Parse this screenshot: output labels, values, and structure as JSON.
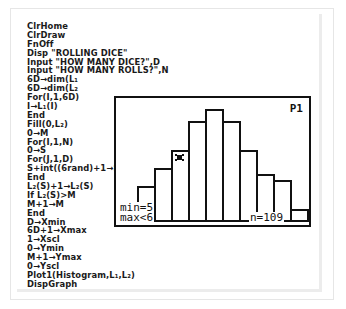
{
  "program": {
    "lines": [
      "ClrHome",
      "ClrDraw",
      "FnOff",
      "Disp \"ROLLING DICE\"",
      "Input \"HOW MANY DICE?\",D",
      "Input \"HOW MANY ROLLS?\",N",
      "6D→dim(L₁",
      "6D→dim(L₂",
      "For(I,1,6D)",
      "I→L₁(I)",
      "End",
      "Fill(0,L₂)",
      "0→M",
      "For(I,1,N)",
      "0→S",
      "For(J,1,D)",
      "S+int((6rand)+1→S",
      "End",
      "L₂(S)+1→L₂(S)",
      "If L₂(S)>M",
      "M+1→M",
      "End",
      "D→Xmin",
      "6D+1→Xmax",
      "1→Xscl",
      "0→Ymin",
      "M+1→Ymax",
      "0→Yscl",
      "Plot1(Histogram,L₁,L₂)",
      "DispGraph"
    ]
  },
  "graph_screen": {
    "plot_label": "P1",
    "trace": {
      "min_label": "min=5",
      "max_label": "max<6",
      "n_label": "n=109"
    }
  },
  "chart_data": {
    "type": "bar",
    "title": "",
    "xlabel": "",
    "ylabel": "",
    "categories": [
      "3",
      "4",
      "5",
      "6",
      "7",
      "8",
      "9",
      "10",
      "11",
      "12"
    ],
    "values": [
      6,
      9,
      12,
      17,
      19,
      17,
      12,
      8,
      7,
      2
    ],
    "legend": [
      "P1"
    ],
    "grid": false,
    "annotations": [
      "min=5",
      "max<6",
      "n=109"
    ]
  }
}
